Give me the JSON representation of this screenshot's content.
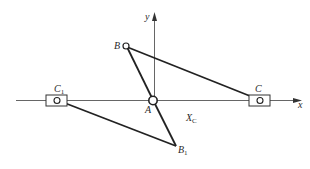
{
  "diagram": {
    "type": "mechanism-kinematic-sketch",
    "axes": {
      "x_label": "x",
      "y_label": "y"
    },
    "points": {
      "A": {
        "label": "A",
        "sub": "",
        "role": "fixed pivot at origin"
      },
      "B": {
        "label": "B",
        "sub": "",
        "role": "crank end (position 1)"
      },
      "C": {
        "label": "C",
        "sub": "",
        "role": "slider (position 1)"
      },
      "B1": {
        "label": "B",
        "sub": "1",
        "role": "crank end (position 2)"
      },
      "C1": {
        "label": "C",
        "sub": "1",
        "role": "slider (position 2)"
      }
    },
    "dimension": {
      "label": "X",
      "sub": "C"
    },
    "links": [
      {
        "from": "A",
        "to": "B",
        "name": "crank AB"
      },
      {
        "from": "B",
        "to": "C",
        "name": "connecting rod BC"
      },
      {
        "from": "A",
        "to": "B1",
        "name": "crank AB1"
      },
      {
        "from": "B1",
        "to": "C1",
        "name": "connecting rod B1C1"
      }
    ],
    "colors": {
      "line": "#2a2a2a",
      "axis": "#555555",
      "background": "#ffffff"
    }
  }
}
